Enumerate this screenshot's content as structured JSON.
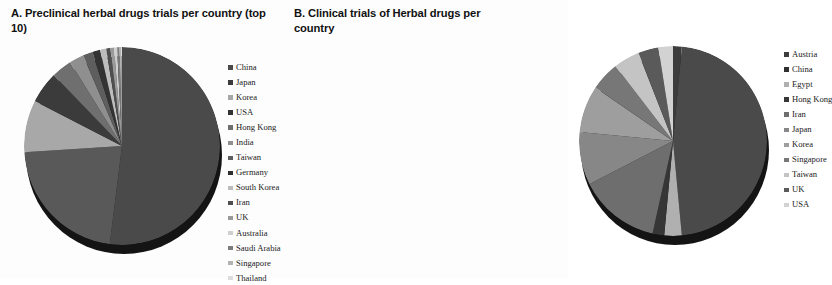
{
  "figure": {
    "background": "#fdfdfd",
    "panels": [
      "A",
      "B"
    ]
  },
  "panel_a": {
    "title": "A. Preclinical herbal drugs trials per country (top 10)",
    "legend_position": "right"
  },
  "panel_b": {
    "title": "B. Clinical trials of Herbal drugs per country",
    "legend_position": "right"
  },
  "chart_data": [
    {
      "type": "pie",
      "title": "A. Preclinical herbal drugs trials per country (top 10)",
      "xlabel": "",
      "ylabel": "",
      "legend": "right",
      "grid": false,
      "start_angle": 0,
      "direction": "clockwise",
      "categories": [
        "China",
        "Japan",
        "Korea",
        "USA",
        "Hong Kong",
        "India",
        "Taiwan",
        "Germany",
        "South Korea",
        "Iran",
        "UK",
        "Australia",
        "Saudi Arabia",
        "Singapore",
        "Thailand"
      ],
      "values": [
        52.0,
        22.0,
        8.5,
        5.2,
        3.4,
        2.4,
        1.6,
        1.3,
        1.0,
        0.7,
        0.6,
        0.5,
        0.4,
        0.3,
        0.1
      ],
      "colors": [
        "#4a4a4a",
        "#595959",
        "#a8a8a8",
        "#3b3b3b",
        "#6f6f6f",
        "#8f8f8f",
        "#5e5e5e",
        "#333333",
        "#bdbdbd",
        "#4f4f4f",
        "#9a9a9a",
        "#cfcfcf",
        "#7c7c7c",
        "#b3b3b3",
        "#e0e0e0"
      ]
    },
    {
      "type": "pie",
      "title": "B. Clinical trials of Herbal drugs per country",
      "xlabel": "",
      "ylabel": "",
      "legend": "right",
      "grid": false,
      "start_angle": 0,
      "direction": "clockwise",
      "categories": [
        "Austria",
        "China",
        "Egypt",
        "Hong Kong",
        "Iran",
        "Japan",
        "Korea",
        "Singapore",
        "Taiwan",
        "UK",
        "USA"
      ],
      "values": [
        1.5,
        47.0,
        3.0,
        2.0,
        14.0,
        9.0,
        8.0,
        5.0,
        4.5,
        3.5,
        2.5
      ],
      "colors": [
        "#3c3c3c",
        "#4a4a4a",
        "#b0b0b0",
        "#363636",
        "#6e6e6e",
        "#878787",
        "#9e9e9e",
        "#777777",
        "#c4c4c4",
        "#5a5a5a",
        "#d2d2d2"
      ]
    }
  ],
  "legend_a": {
    "items": [
      {
        "label": "China",
        "color": "#4a4a4a"
      },
      {
        "label": "Japan",
        "color": "#3b3b3b"
      },
      {
        "label": "Korea",
        "color": "#a8a8a8"
      },
      {
        "label": "USA",
        "color": "#333333"
      },
      {
        "label": "Hong Kong",
        "color": "#6f6f6f"
      },
      {
        "label": "India",
        "color": "#8f8f8f"
      },
      {
        "label": "Taiwan",
        "color": "#5e5e5e"
      },
      {
        "label": "Germany",
        "color": "#2e2e2e"
      },
      {
        "label": "South Korea",
        "color": "#bdbdbd"
      },
      {
        "label": "Iran",
        "color": "#4f4f4f"
      },
      {
        "label": "UK",
        "color": "#9a9a9a"
      },
      {
        "label": "Australia",
        "color": "#cfcfcf"
      },
      {
        "label": "Saudi Arabia",
        "color": "#7c7c7c"
      },
      {
        "label": "Singapore",
        "color": "#b3b3b3"
      },
      {
        "label": "Thailand",
        "color": "#dcdcdc"
      }
    ]
  },
  "legend_b": {
    "items": [
      {
        "label": "Austria",
        "color": "#3c3c3c"
      },
      {
        "label": "China",
        "color": "#2f2f2f"
      },
      {
        "label": "Egypt",
        "color": "#b0b0b0"
      },
      {
        "label": "Hong Kong",
        "color": "#363636"
      },
      {
        "label": "Iran",
        "color": "#6e6e6e"
      },
      {
        "label": "Japan",
        "color": "#878787"
      },
      {
        "label": "Korea",
        "color": "#9e9e9e"
      },
      {
        "label": "Singapore",
        "color": "#777777"
      },
      {
        "label": "Taiwan",
        "color": "#c4c4c4"
      },
      {
        "label": "UK",
        "color": "#5a5a5a"
      },
      {
        "label": "USA",
        "color": "#d2d2d2"
      }
    ]
  }
}
